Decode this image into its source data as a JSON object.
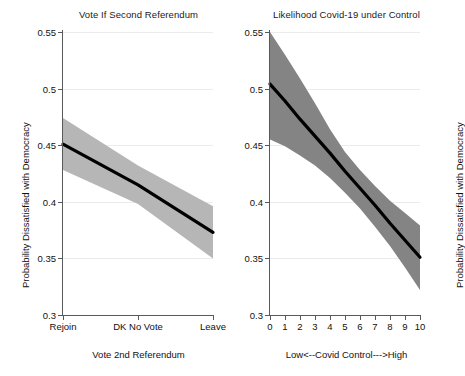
{
  "figure": {
    "background": "#ffffff",
    "line_color": "#000000"
  },
  "chart_data": [
    {
      "type": "line",
      "panel": "left",
      "title": "Vote If Second Referendum",
      "xlabel": "Vote 2nd Referendum",
      "ylabel": "Probability Dissatisfied with Democracy",
      "grid": true,
      "legend": "none",
      "ylim": [
        0.3,
        0.55
      ],
      "yticks": [
        0.3,
        0.35,
        0.4,
        0.45,
        0.5,
        0.55
      ],
      "ytick_labels": [
        "0.3",
        "0.35",
        "0.4",
        "0.45",
        "0.5",
        "0.55"
      ],
      "xlim": [
        0,
        2
      ],
      "xticks": [
        0,
        1,
        2
      ],
      "xtick_labels": [
        "Rejoin",
        "DK No Vote",
        "Leave"
      ],
      "categories": [
        "Rejoin",
        "DK No Vote",
        "Leave"
      ],
      "x": [
        0,
        1,
        2
      ],
      "values": [
        0.451,
        0.415,
        0.373
      ],
      "ci_lower": [
        0.428,
        0.398,
        0.35
      ],
      "ci_upper": [
        0.474,
        0.432,
        0.396
      ],
      "band_color": "#b6b6b6",
      "band_label": "95% confidence interval"
    },
    {
      "type": "line",
      "panel": "right",
      "title": "Likelihood Covid-19 under Control",
      "xlabel": "Low<--Covid Control--->High",
      "ylabel": "Probability Dissatisfied with Democracy",
      "grid": true,
      "legend": "none",
      "ylim": [
        0.3,
        0.55
      ],
      "yticks": [
        0.3,
        0.35,
        0.4,
        0.45,
        0.5,
        0.55
      ],
      "ytick_labels": [
        "0.3",
        "0.35",
        "0.4",
        "0.45",
        "0.5",
        "0.55"
      ],
      "xlim": [
        0,
        10
      ],
      "xticks": [
        0,
        1,
        2,
        3,
        4,
        5,
        6,
        7,
        8,
        9,
        10
      ],
      "xtick_labels": [
        "0",
        "1",
        "2",
        "3",
        "4",
        "5",
        "6",
        "7",
        "8",
        "9",
        "10"
      ],
      "categories": [
        "0",
        "1",
        "2",
        "3",
        "4",
        "5",
        "6",
        "7",
        "8",
        "9",
        "10"
      ],
      "x": [
        0,
        1,
        2,
        3,
        4,
        5,
        6,
        7,
        8,
        9,
        10
      ],
      "values": [
        0.504,
        0.489,
        0.473,
        0.458,
        0.443,
        0.427,
        0.412,
        0.397,
        0.381,
        0.366,
        0.351
      ],
      "ci_lower": [
        0.455,
        0.449,
        0.441,
        0.432,
        0.421,
        0.408,
        0.394,
        0.378,
        0.361,
        0.342,
        0.322
      ],
      "ci_upper": [
        0.55,
        0.53,
        0.509,
        0.487,
        0.464,
        0.444,
        0.428,
        0.414,
        0.401,
        0.39,
        0.379
      ],
      "band_color": "#848484",
      "band_label": "95% confidence interval"
    }
  ]
}
